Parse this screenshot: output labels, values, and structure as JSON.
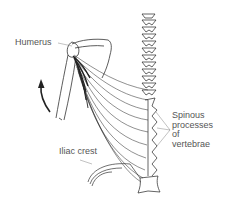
{
  "diagram": {
    "labels": {
      "humerus": "Humerus",
      "iliac_crest": "Iliac crest",
      "spinous_processes": [
        "Spinous",
        "processes",
        "of",
        "vertebrae"
      ]
    },
    "arrow": "curved arrow indicating arm adduction/extension motion",
    "colors": {
      "line": "#222222",
      "label": "#555555",
      "background": "#ffffff"
    }
  }
}
